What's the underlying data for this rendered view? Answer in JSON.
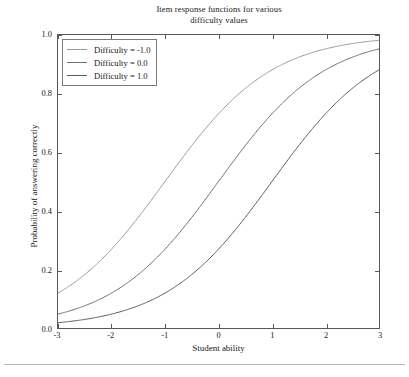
{
  "figure": {
    "width": 409,
    "height": 377,
    "background": "#ffffff",
    "axes_color": "#585858",
    "text_color": "#1a1a1a",
    "footer_rule_color": "#b4b4b4"
  },
  "title": {
    "line1": "Item response functions for various",
    "line2": "difficulty values"
  },
  "axes": {
    "xlabel": "Student ability",
    "ylabel": "Probability of answering correctly",
    "xticks": [
      "-3",
      "-2",
      "-1",
      "0",
      "1",
      "2",
      "3"
    ],
    "yticks": [
      "0.0",
      "0.2",
      "0.4",
      "0.6",
      "0.8",
      "1.0"
    ]
  },
  "legend": {
    "entries": [
      {
        "label": "Difficulty = -1.0",
        "color": "#9a9a9a"
      },
      {
        "label": "Difficulty = 0.0",
        "color": "#6e6e6e"
      },
      {
        "label": "Difficulty = 1.0",
        "color": "#5a5a5a"
      }
    ]
  },
  "chart_data": {
    "type": "line",
    "title": "Item response functions for various difficulty values",
    "xlabel": "Student ability",
    "ylabel": "Probability of answering correctly",
    "xlim": [
      -3,
      3
    ],
    "ylim": [
      0,
      1
    ],
    "xticks": [
      -3,
      -2,
      -1,
      0,
      1,
      2,
      3
    ],
    "yticks": [
      0.0,
      0.2,
      0.4,
      0.6,
      0.8,
      1.0
    ],
    "grid": false,
    "legend_position": "upper left",
    "model": "1PL logistic: P(theta) = 1 / (1 + exp(-(theta - b)))",
    "x": [
      -3.0,
      -2.5,
      -2.0,
      -1.5,
      -1.0,
      -0.5,
      0.0,
      0.5,
      1.0,
      1.5,
      2.0,
      2.5,
      3.0
    ],
    "series": [
      {
        "name": "Difficulty = -1.0",
        "difficulty": -1.0,
        "color": "#9a9a9a",
        "values": [
          0.119,
          0.182,
          0.269,
          0.378,
          0.5,
          0.622,
          0.731,
          0.818,
          0.881,
          0.924,
          0.953,
          0.971,
          0.982
        ]
      },
      {
        "name": "Difficulty = 0.0",
        "difficulty": 0.0,
        "color": "#6e6e6e",
        "values": [
          0.047,
          0.076,
          0.119,
          0.182,
          0.269,
          0.378,
          0.5,
          0.622,
          0.731,
          0.818,
          0.881,
          0.924,
          0.953
        ]
      },
      {
        "name": "Difficulty = 1.0",
        "difficulty": 1.0,
        "color": "#5a5a5a",
        "values": [
          0.018,
          0.029,
          0.047,
          0.076,
          0.119,
          0.182,
          0.269,
          0.378,
          0.5,
          0.622,
          0.731,
          0.818,
          0.881
        ]
      }
    ]
  }
}
